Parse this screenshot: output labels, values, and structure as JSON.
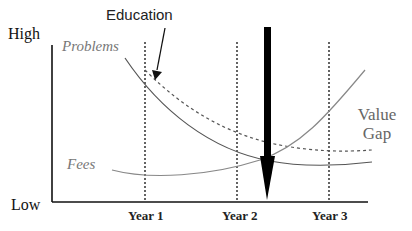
{
  "diagram": {
    "y_axis": {
      "high_label": "High",
      "low_label": "Low"
    },
    "x_axis": {
      "ticks": [
        "Year 1",
        "Year 2",
        "Year 3"
      ]
    },
    "curves": [
      {
        "name": "Problems",
        "style": "solid",
        "trend": "decreasing"
      },
      {
        "name": "Education-adjusted Problems",
        "style": "dashed",
        "trend": "decreasing"
      },
      {
        "name": "Fees",
        "style": "solid",
        "trend": "increasing"
      }
    ],
    "annotations": {
      "education": "Education",
      "problems": "Problems",
      "fees": "Fees",
      "value_gap_line1": "Value",
      "value_gap_line2": "Gap"
    },
    "colors": {
      "axis": "#111111",
      "curve": "#666666",
      "arrow": "#000000"
    }
  }
}
